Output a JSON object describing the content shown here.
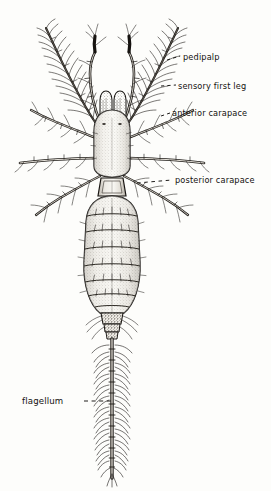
{
  "figure": {
    "background_color": "#fdfdfb",
    "ink_color": "#13110f",
    "style": "pen-and-ink stipple line drawing"
  },
  "labels": [
    {
      "id": "pedipalp",
      "text": "pedipalp",
      "text_x": 183,
      "text_y": 58,
      "leader_x1": 167,
      "leader_y1": 60,
      "leader_x2": 180,
      "leader_y2": 56,
      "dashes": 2
    },
    {
      "id": "sensory-first-leg",
      "text": "sensory first leg",
      "text_x": 178,
      "text_y": 87,
      "leader_x1": 162,
      "leader_y1": 86,
      "leader_x2": 176,
      "leader_y2": 85,
      "dashes": 2
    },
    {
      "id": "anterior-carapace",
      "text": "anterior carapace",
      "text_x": 172,
      "text_y": 114,
      "leader_x1": 161,
      "leader_y1": 116,
      "leader_x2": 170,
      "leader_y2": 113,
      "dashes": 1
    },
    {
      "id": "posterior-carapace",
      "text": "posterior carapace",
      "text_x": 175,
      "text_y": 182,
      "leader_x1": 137,
      "leader_y1": 183,
      "leader_x2": 172,
      "leader_y2": 180,
      "dashes": 4
    },
    {
      "id": "flagellum",
      "text": "flagellum",
      "text_x": 22,
      "text_y": 403,
      "leader_x1": 84,
      "leader_y1": 401,
      "leader_x2": 113,
      "leader_y2": 401,
      "dashes": 4
    }
  ],
  "anatomy": {
    "anterior_carapace": {
      "cx": 112,
      "cy": 142,
      "rx": 18,
      "ry": 32,
      "note": "elongated oval shield"
    },
    "posterior_carapace": {
      "x": 100,
      "y": 176,
      "w": 26,
      "h": 20,
      "note": "small trapezoidal plate"
    },
    "opisthosoma": {
      "cx": 112,
      "cy": 255,
      "rx": 26,
      "ry": 58,
      "segments": 8,
      "note": "segmented abdomen with setae"
    },
    "flagellum": {
      "x": 112,
      "y_start": 318,
      "y_end": 478,
      "segments": 13,
      "note": "long whip-like segmented tail with bristles"
    },
    "chelicerae": {
      "count": 2,
      "cx": 112,
      "cy": 108,
      "note": "two short median palps"
    },
    "pedipalps": {
      "count": 2,
      "note": "inner pair of curved raptorial appendages"
    },
    "sensory_first_legs": {
      "count": 2,
      "note": "outer long whip-like bristled first legs"
    },
    "walking_legs": {
      "count": 6,
      "note": "three pairs splaying laterally from carapace"
    }
  }
}
